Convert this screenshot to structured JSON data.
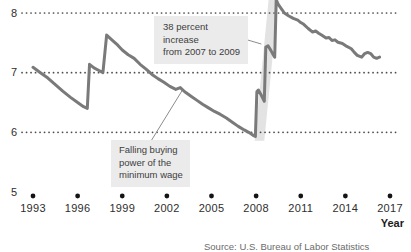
{
  "chart_data": {
    "type": "line",
    "xlabel": "Year",
    "ylabel": "",
    "xlim": [
      1993,
      2017
    ],
    "ylim": [
      5,
      8.25
    ],
    "x_ticks": [
      1993,
      1996,
      1999,
      2002,
      2005,
      2008,
      2011,
      2014,
      2017
    ],
    "y_ticks": [
      5,
      6,
      7,
      8
    ],
    "gridlines_at": [
      6,
      7,
      8
    ],
    "series": [
      {
        "name": "Buying power of the minimum wage (dollars)",
        "points": [
          [
            1993.0,
            7.09
          ],
          [
            1993.5,
            7.0
          ],
          [
            1994.0,
            6.91
          ],
          [
            1994.5,
            6.8
          ],
          [
            1995.0,
            6.69
          ],
          [
            1995.5,
            6.59
          ],
          [
            1996.0,
            6.5
          ],
          [
            1996.4,
            6.43
          ],
          [
            1996.65,
            6.4
          ],
          [
            1996.8,
            7.14
          ],
          [
            1997.1,
            7.08
          ],
          [
            1997.4,
            7.04
          ],
          [
            1997.7,
            7.0
          ],
          [
            1997.95,
            7.63
          ],
          [
            1998.3,
            7.55
          ],
          [
            1998.7,
            7.46
          ],
          [
            1999.0,
            7.38
          ],
          [
            1999.4,
            7.3
          ],
          [
            1999.8,
            7.24
          ],
          [
            2000.2,
            7.14
          ],
          [
            2000.6,
            7.06
          ],
          [
            2001.0,
            6.97
          ],
          [
            2001.4,
            6.9
          ],
          [
            2001.8,
            6.84
          ],
          [
            2002.2,
            6.77
          ],
          [
            2002.6,
            6.72
          ],
          [
            2002.9,
            6.75
          ],
          [
            2003.2,
            6.68
          ],
          [
            2003.6,
            6.61
          ],
          [
            2004.0,
            6.54
          ],
          [
            2004.4,
            6.47
          ],
          [
            2004.8,
            6.41
          ],
          [
            2005.2,
            6.35
          ],
          [
            2005.6,
            6.3
          ],
          [
            2006.0,
            6.24
          ],
          [
            2006.4,
            6.17
          ],
          [
            2006.8,
            6.1
          ],
          [
            2007.2,
            6.04
          ],
          [
            2007.5,
            6.0
          ],
          [
            2007.8,
            5.95
          ],
          [
            2007.95,
            5.93
          ],
          [
            2008.05,
            6.68
          ],
          [
            2008.15,
            6.71
          ],
          [
            2008.35,
            6.62
          ],
          [
            2008.55,
            6.52
          ],
          [
            2008.65,
            7.43
          ],
          [
            2008.8,
            7.45
          ],
          [
            2009.0,
            7.37
          ],
          [
            2009.15,
            7.3
          ],
          [
            2009.25,
            7.26
          ],
          [
            2009.35,
            8.22
          ],
          [
            2009.5,
            8.14
          ],
          [
            2009.7,
            8.07
          ],
          [
            2009.9,
            8.0
          ],
          [
            2010.2,
            7.95
          ],
          [
            2010.5,
            7.91
          ],
          [
            2010.8,
            7.88
          ],
          [
            2011.0,
            7.84
          ],
          [
            2011.2,
            7.81
          ],
          [
            2011.5,
            7.74
          ],
          [
            2011.8,
            7.68
          ],
          [
            2012.0,
            7.7
          ],
          [
            2012.2,
            7.66
          ],
          [
            2012.4,
            7.63
          ],
          [
            2012.7,
            7.58
          ],
          [
            2012.9,
            7.59
          ],
          [
            2013.1,
            7.54
          ],
          [
            2013.3,
            7.55
          ],
          [
            2013.5,
            7.51
          ],
          [
            2013.8,
            7.49
          ],
          [
            2014.1,
            7.44
          ],
          [
            2014.4,
            7.4
          ],
          [
            2014.6,
            7.34
          ],
          [
            2014.8,
            7.29
          ],
          [
            2015.1,
            7.26
          ],
          [
            2015.3,
            7.32
          ],
          [
            2015.5,
            7.34
          ],
          [
            2015.7,
            7.32
          ],
          [
            2015.9,
            7.26
          ],
          [
            2016.1,
            7.24
          ],
          [
            2016.3,
            7.26
          ]
        ]
      }
    ],
    "highlight_band": {
      "polygon": [
        [
          2007.9,
          5.86
        ],
        [
          2008.55,
          5.86
        ],
        [
          2009.5,
          8.25
        ],
        [
          2008.85,
          8.25
        ]
      ]
    },
    "annotations": [
      {
        "id": "increase",
        "lines": [
          "38 percent increase",
          "from 2007 to 2009"
        ],
        "leader": [
          [
            2007.4,
            7.55
          ],
          [
            2008.35,
            7.48
          ]
        ]
      },
      {
        "id": "falling",
        "lines": [
          "Falling buying",
          "power of the",
          "minimum wage"
        ],
        "leader": [
          [
            2000.95,
            5.86
          ],
          [
            2003.05,
            6.71
          ]
        ]
      }
    ]
  },
  "axis_title": "Year",
  "source": "Source: U.S. Bureau of Labor Statistics",
  "colors": {
    "line": "#7a7a7a",
    "highlight_band": "#e3e3e3",
    "gridline": "#4d4d4d",
    "tick_dot": "#141414",
    "annotation_bg": "#ebebeb",
    "annotation_text": "#3d3d3d",
    "axis_text": "#2e2e2e",
    "leader_line": "#8c8c8c",
    "source_text": "#6b6b6b"
  }
}
